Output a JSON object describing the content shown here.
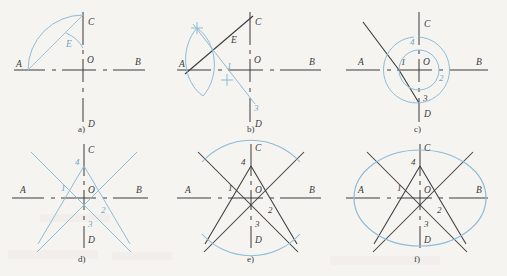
{
  "figure": {
    "background_color": "#f6f4f1",
    "ink_color": "#3b3b3b",
    "construction_color": "#7fb5d5",
    "axis_labels": {
      "a_label": "A",
      "b_label": "B",
      "c_label": "C",
      "d_label": "D",
      "o_label": "O",
      "e_label": "E"
    },
    "point_labels": {
      "p1": "1",
      "p2": "2",
      "p3": "3",
      "p4": "4"
    }
  },
  "panels": [
    {
      "id": "a",
      "caption": "a)",
      "labels": {
        "A": "A",
        "B": "B",
        "C": "C",
        "D": "D",
        "O": "O",
        "E": "E"
      },
      "description": "Axes AB and CD with arc from A through C and small arc locating E"
    },
    {
      "id": "b",
      "caption": "b)",
      "labels": {
        "A": "A",
        "B": "B",
        "C": "C",
        "D": "D",
        "O": "O",
        "E": "E",
        "p1": "1",
        "p3": "3"
      },
      "description": "Perpendicular bisector of AE drawn with vesica arcs, giving points 1 and 3"
    },
    {
      "id": "c",
      "caption": "c)",
      "labels": {
        "A": "A",
        "B": "B",
        "C": "C",
        "D": "D",
        "O": "O",
        "p1": "1",
        "p2": "2",
        "p3": "3",
        "p4": "4"
      },
      "description": "Arcs about O transfer distances to locate centres 1, 2, 3 and 4"
    },
    {
      "id": "d",
      "caption": "d)",
      "labels": {
        "A": "A",
        "B": "B",
        "C": "C",
        "D": "D",
        "O": "O",
        "p1": "1",
        "p2": "2",
        "p3": "3",
        "p4": "4"
      },
      "description": "Construction rays through 4-1, 4-2, 3-1, 3-2 extended both ways"
    },
    {
      "id": "e",
      "caption": "e)",
      "labels": {
        "A": "A",
        "B": "B",
        "C": "C",
        "D": "D",
        "O": "O",
        "p1": "1",
        "p2": "2",
        "p3": "3",
        "p4": "4"
      },
      "description": "Large arcs struck from centres 3 and 4 between the rays"
    },
    {
      "id": "f",
      "caption": "f)",
      "labels": {
        "A": "A",
        "B": "B",
        "C": "C",
        "D": "D",
        "O": "O",
        "p1": "1",
        "p2": "2",
        "p3": "3",
        "p4": "4"
      },
      "description": "Small arcs from centres 1 and 2 complete the closed oval"
    }
  ]
}
